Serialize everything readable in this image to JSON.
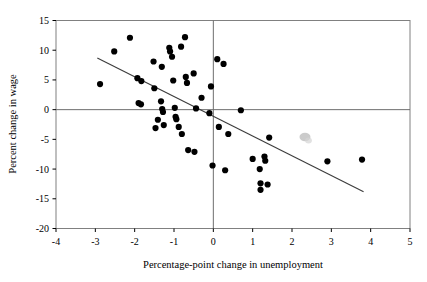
{
  "chart_data": {
    "type": "scatter",
    "title": "",
    "xlabel": "Percentage-point change in unemployment",
    "ylabel": "Percent change in wage",
    "xlim": [
      -4,
      5
    ],
    "ylim": [
      -20,
      15
    ],
    "xticks": [
      -4,
      -3,
      -2,
      -1,
      0,
      1,
      2,
      3,
      4,
      5
    ],
    "yticks": [
      15,
      10,
      5,
      0,
      -5,
      -10,
      -15,
      -20
    ],
    "xticklabels": [
      "-4",
      "-3",
      "-2",
      "-1",
      "0",
      "1",
      "2",
      "3",
      "4",
      "5"
    ],
    "yticklabels": [
      "15",
      "10",
      "5",
      "0",
      "-5",
      "-10",
      "-15",
      "-20"
    ],
    "grid": false,
    "legend": null,
    "zero_lines": {
      "horizontal_y": 0,
      "vertical_x": 0
    },
    "marker": {
      "shape": "circle",
      "color": "#000000",
      "size": 3.1
    },
    "trendline": {
      "type": "linear",
      "color": "#3b3b3b",
      "x_start": -2.95,
      "y_start": 8.7,
      "x_end": 3.82,
      "y_end": -13.8
    },
    "artifact": {
      "description": "faint grey smudge",
      "x": 2.33,
      "y": -4.6,
      "color": "#b9b9b9"
    },
    "points": [
      {
        "x": -2.88,
        "y": 4.3
      },
      {
        "x": -2.52,
        "y": 9.8
      },
      {
        "x": -2.12,
        "y": 12.1
      },
      {
        "x": -1.93,
        "y": 5.3
      },
      {
        "x": -1.9,
        "y": 1.1
      },
      {
        "x": -1.84,
        "y": 0.9
      },
      {
        "x": -1.83,
        "y": 4.8
      },
      {
        "x": -1.52,
        "y": 8.1
      },
      {
        "x": -1.5,
        "y": 3.6
      },
      {
        "x": -1.47,
        "y": -3.1
      },
      {
        "x": -1.41,
        "y": -1.7
      },
      {
        "x": -1.33,
        "y": 1.4
      },
      {
        "x": -1.31,
        "y": 7.2
      },
      {
        "x": -1.3,
        "y": 0.1
      },
      {
        "x": -1.28,
        "y": -0.4
      },
      {
        "x": -1.26,
        "y": -2.6
      },
      {
        "x": -1.12,
        "y": 10.4
      },
      {
        "x": -1.1,
        "y": 9.8
      },
      {
        "x": -1.05,
        "y": 8.9
      },
      {
        "x": -1.02,
        "y": 4.9
      },
      {
        "x": -0.98,
        "y": 0.3
      },
      {
        "x": -0.96,
        "y": -1.2
      },
      {
        "x": -0.94,
        "y": -1.6
      },
      {
        "x": -0.88,
        "y": -2.9
      },
      {
        "x": -0.82,
        "y": 10.6
      },
      {
        "x": -0.8,
        "y": -4.1
      },
      {
        "x": -0.72,
        "y": 12.2
      },
      {
        "x": -0.7,
        "y": 5.5
      },
      {
        "x": -0.67,
        "y": 4.5
      },
      {
        "x": -0.64,
        "y": -6.8
      },
      {
        "x": -0.5,
        "y": 6.1
      },
      {
        "x": -0.48,
        "y": -7.1
      },
      {
        "x": -0.44,
        "y": 0.2
      },
      {
        "x": -0.3,
        "y": 2.0
      },
      {
        "x": -0.1,
        "y": -0.6
      },
      {
        "x": -0.06,
        "y": 3.9
      },
      {
        "x": -0.02,
        "y": -9.4
      },
      {
        "x": 0.1,
        "y": 8.5
      },
      {
        "x": 0.14,
        "y": -2.9
      },
      {
        "x": 0.26,
        "y": 7.7
      },
      {
        "x": 0.3,
        "y": -10.2
      },
      {
        "x": 0.38,
        "y": -4.1
      },
      {
        "x": 0.7,
        "y": -0.1
      },
      {
        "x": 1.0,
        "y": -8.3
      },
      {
        "x": 1.18,
        "y": -10.0
      },
      {
        "x": 1.2,
        "y": -12.4
      },
      {
        "x": 1.2,
        "y": -13.5
      },
      {
        "x": 1.3,
        "y": -7.9
      },
      {
        "x": 1.32,
        "y": -8.6
      },
      {
        "x": 1.38,
        "y": -12.6
      },
      {
        "x": 1.42,
        "y": -4.7
      },
      {
        "x": 2.9,
        "y": -8.7
      },
      {
        "x": 3.78,
        "y": -8.4
      }
    ]
  },
  "axes_style": {
    "frame_color": "#808080",
    "zero_line_color": "#6e6e6e",
    "tick_color": "#000000"
  }
}
